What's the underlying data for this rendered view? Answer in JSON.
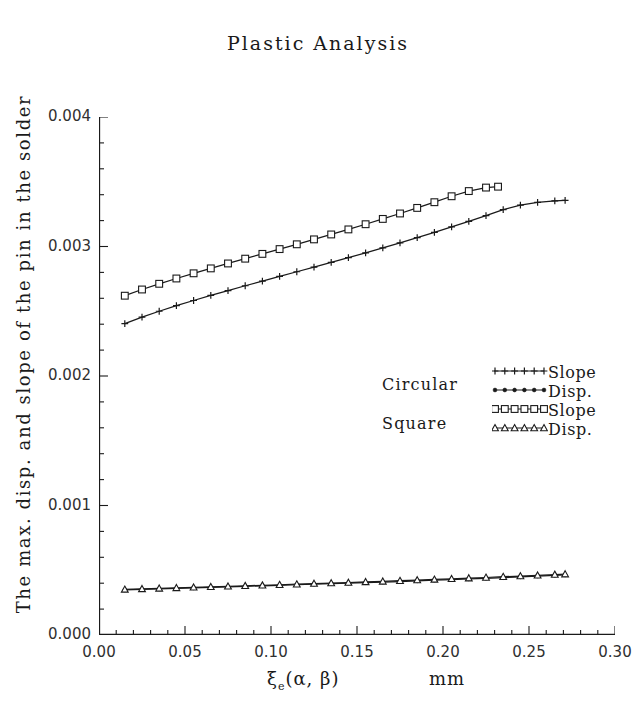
{
  "chart_data": {
    "type": "line",
    "title": "Plastic Analysis",
    "xlabel_symbol": "ξ",
    "xlabel_sub": "e",
    "xlabel_args": "(α, β)",
    "xlabel_unit": "mm",
    "ylabel": "The max. disp. and slope of the pin in the solder",
    "xlim": [
      0.0,
      0.3
    ],
    "ylim": [
      0.0,
      0.004
    ],
    "xticks": [
      0.0,
      0.05,
      0.1,
      0.15,
      0.2,
      0.25,
      0.3
    ],
    "xticklabels": [
      "0.00",
      "0.05",
      "0.10",
      "0.15",
      "0.20",
      "0.25",
      "0.30"
    ],
    "yticks": [
      0.0,
      0.001,
      0.002,
      0.003,
      0.004
    ],
    "yticklabels": [
      "0.000",
      "0.001",
      "0.002",
      "0.003",
      "0.004"
    ],
    "minor_ticks_per_interval": 5,
    "grid": false,
    "legend_position": "center-right",
    "legend_groups": [
      {
        "label": "Circular",
        "entries": [
          "Slope",
          "Disp."
        ]
      },
      {
        "label": "Square",
        "entries": [
          "Slope",
          "Disp."
        ]
      }
    ],
    "series": [
      {
        "name": "Circular Slope",
        "group": "Circular",
        "quantity": "Slope",
        "marker": "plus",
        "color": "#1a1a1a",
        "x": [
          0.015,
          0.025,
          0.035,
          0.045,
          0.055,
          0.065,
          0.075,
          0.085,
          0.095,
          0.105,
          0.115,
          0.125,
          0.135,
          0.145,
          0.155,
          0.165,
          0.175,
          0.185,
          0.195,
          0.205,
          0.215,
          0.225,
          0.235,
          0.245,
          0.255,
          0.265,
          0.271
        ],
        "y": [
          0.002405,
          0.002455,
          0.0025,
          0.002543,
          0.002583,
          0.002622,
          0.00266,
          0.002697,
          0.002733,
          0.002769,
          0.002805,
          0.002841,
          0.002877,
          0.002914,
          0.002951,
          0.002989,
          0.003028,
          0.003068,
          0.003109,
          0.003151,
          0.003194,
          0.003239,
          0.003285,
          0.00332,
          0.00334,
          0.003352,
          0.003356
        ]
      },
      {
        "name": "Square Slope",
        "group": "Square",
        "quantity": "Slope",
        "marker": "square",
        "color": "#1a1a1a",
        "x": [
          0.015,
          0.025,
          0.035,
          0.045,
          0.055,
          0.065,
          0.075,
          0.085,
          0.095,
          0.105,
          0.115,
          0.125,
          0.135,
          0.145,
          0.155,
          0.165,
          0.175,
          0.185,
          0.195,
          0.205,
          0.215,
          0.225,
          0.232
        ],
        "y": [
          0.00262,
          0.002668,
          0.002712,
          0.002753,
          0.002793,
          0.002831,
          0.002869,
          0.002906,
          0.002943,
          0.00298,
          0.003017,
          0.003055,
          0.003093,
          0.003132,
          0.003172,
          0.003213,
          0.003255,
          0.003298,
          0.003342,
          0.003388,
          0.003428,
          0.003455,
          0.003462
        ]
      },
      {
        "name": "Circular Disp.",
        "group": "Circular",
        "quantity": "Disp.",
        "marker": "dot",
        "color": "#1a1a1a",
        "x": [
          0.015,
          0.025,
          0.035,
          0.045,
          0.055,
          0.065,
          0.075,
          0.085,
          0.095,
          0.105,
          0.115,
          0.125,
          0.135,
          0.145,
          0.155,
          0.165,
          0.175,
          0.185,
          0.195,
          0.205,
          0.215,
          0.225,
          0.235,
          0.245,
          0.255,
          0.265,
          0.271
        ],
        "y": [
          0.000348,
          0.000352,
          0.000356,
          0.00036,
          0.000364,
          0.000368,
          0.000372,
          0.000376,
          0.00038,
          0.000384,
          0.000388,
          0.000392,
          0.000396,
          0.0004,
          0.000404,
          0.000409,
          0.000413,
          0.000418,
          0.000423,
          0.000428,
          0.000433,
          0.000438,
          0.000443,
          0.000449,
          0.000455,
          0.000461,
          0.000464
        ]
      },
      {
        "name": "Square Disp.",
        "group": "Square",
        "quantity": "Disp.",
        "marker": "triangle",
        "color": "#1a1a1a",
        "x": [
          0.015,
          0.025,
          0.035,
          0.045,
          0.055,
          0.065,
          0.075,
          0.085,
          0.095,
          0.105,
          0.115,
          0.125,
          0.135,
          0.145,
          0.155,
          0.165,
          0.175,
          0.185,
          0.195,
          0.205,
          0.215,
          0.225,
          0.235,
          0.245,
          0.255,
          0.265,
          0.271
        ],
        "y": [
          0.000352,
          0.000356,
          0.00036,
          0.000364,
          0.000368,
          0.000372,
          0.000376,
          0.00038,
          0.000384,
          0.000388,
          0.000392,
          0.000397,
          0.000401,
          0.000405,
          0.00041,
          0.000414,
          0.000419,
          0.000424,
          0.000429,
          0.000434,
          0.000439,
          0.000444,
          0.00045,
          0.000455,
          0.000461,
          0.000467,
          0.00047
        ]
      }
    ]
  }
}
